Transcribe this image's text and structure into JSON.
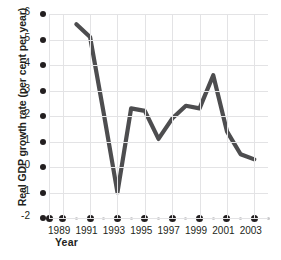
{
  "chart_data": {
    "type": "line",
    "title": "",
    "xlabel": "Year",
    "ylabel": "Real GDP growth rate (per cent per year)",
    "x": [
      1990,
      1991,
      1992,
      1993,
      1994,
      1995,
      1996,
      1997,
      1998,
      1999,
      2000,
      2001,
      2002,
      2003
    ],
    "values": [
      5.6,
      5.1,
      2.1,
      -1.0,
      2.3,
      2.2,
      1.1,
      1.9,
      2.4,
      2.3,
      3.6,
      1.4,
      0.5,
      0.3
    ],
    "series": [
      {
        "name": "Real GDP growth rate",
        "values": [
          5.6,
          5.1,
          2.1,
          -1.0,
          2.3,
          2.2,
          1.1,
          1.9,
          2.4,
          2.3,
          3.6,
          1.4,
          0.5,
          0.3
        ]
      }
    ],
    "xlim": [
      1988,
      2004
    ],
    "ylim": [
      -2,
      6
    ],
    "y_ticks": [
      6,
      5,
      4,
      3,
      2,
      1,
      0,
      -1,
      -2
    ],
    "y_tick_labels": [
      "6",
      "5",
      "4",
      "3",
      "2",
      "1",
      "0",
      "-1",
      "-2"
    ],
    "x_ticks_major": [
      1988,
      1989,
      1991,
      1993,
      1995,
      1997,
      1999,
      2001,
      2003
    ],
    "x_tick_labels": [
      "",
      "1989",
      "1991",
      "1993",
      "1995",
      "1997",
      "1999",
      "2001",
      "2003"
    ],
    "x_ticks_minor": [
      1990,
      1992,
      1994,
      1996,
      1998,
      2000,
      2002,
      2004
    ],
    "grid": "both",
    "legend": "none",
    "line_color": "#4d4d4f",
    "line_width": 4.2,
    "grid_color": "#e3e3e5",
    "tick_color": "#231f20",
    "minor_tick_color": "#c9c9cb",
    "background": "#ffffff"
  }
}
